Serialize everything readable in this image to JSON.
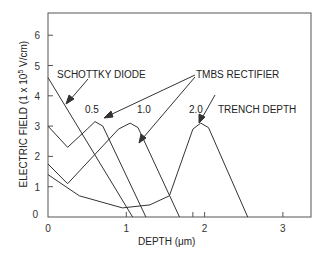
{
  "chart_data": {
    "type": "line",
    "title": "",
    "xlabel": "DEPTH  (μm)",
    "ylabel": "ELECTRIC FIELD  (1 x 10^5 V/cm)",
    "ylabel_main": "ELECTRIC FIELD  (1 x 10",
    "ylabel_sup": "5",
    "ylabel_tail": " V/cm)",
    "xlim": [
      0,
      3.35
    ],
    "ylim": [
      0,
      6.6
    ],
    "xticks": [
      "0",
      "1",
      "2",
      "3"
    ],
    "yticks": [
      "0",
      "1",
      "2",
      "3",
      "4",
      "5",
      "6"
    ],
    "grid": false,
    "annotations": {
      "schottky": "SCHOTTKY DIODE",
      "tmbs": "TMBS RECTIFIER",
      "trench": "TRENCH  DEPTH",
      "d05": "0.5",
      "d10": "1.0",
      "d20": "2.0"
    },
    "series": [
      {
        "name": "SCHOTTKY DIODE",
        "x": [
          0,
          1.08
        ],
        "y": [
          4.6,
          0
        ]
      },
      {
        "name": "TMBS trench depth 0.5",
        "x": [
          0,
          0.25,
          0.5,
          0.6,
          0.7,
          1.25
        ],
        "y": [
          3.0,
          2.3,
          2.9,
          3.15,
          3.0,
          0
        ]
      },
      {
        "name": "TMBS trench depth 1.0",
        "x": [
          0,
          0.25,
          0.9,
          1.05,
          1.15,
          1.68
        ],
        "y": [
          1.75,
          1.1,
          2.9,
          3.1,
          2.95,
          0
        ]
      },
      {
        "name": "TMBS trench depth 2.0",
        "x": [
          0,
          0.4,
          0.95,
          1.3,
          1.55,
          1.85,
          1.95,
          2.05,
          2.55
        ],
        "y": [
          1.4,
          0.7,
          0.3,
          0.4,
          0.7,
          2.9,
          3.1,
          2.95,
          0
        ]
      }
    ]
  }
}
